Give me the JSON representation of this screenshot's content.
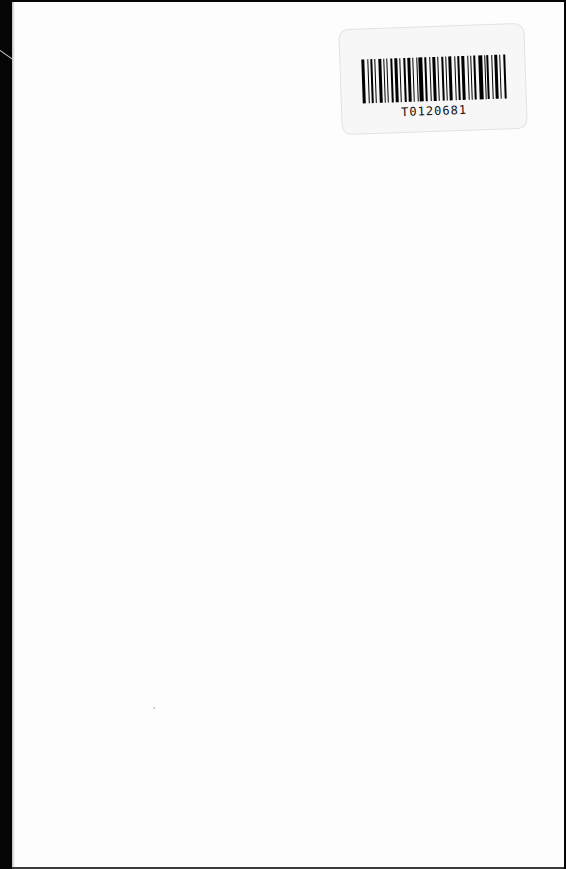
{
  "document": {
    "type": "scanned-page",
    "content": "blank",
    "barcode_label": {
      "text": "T0120681",
      "bars": [
        3,
        1,
        2,
        1,
        4,
        1,
        1,
        2,
        3,
        1,
        2,
        3,
        1,
        1,
        4,
        2,
        1,
        3,
        1,
        2,
        1,
        4,
        1,
        2,
        3,
        1,
        1,
        2,
        4,
        1,
        2,
        1,
        3,
        1,
        2
      ]
    },
    "colors": {
      "page": "#fdfdfd",
      "scan_border": "#050505",
      "barcode": "#000000"
    }
  }
}
